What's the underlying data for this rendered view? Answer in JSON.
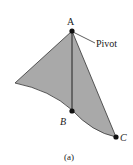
{
  "diagram": {
    "type": "physical-pendulum",
    "colors": {
      "fill": "#a9a9a9",
      "stroke": "#333333",
      "point": "#111111",
      "background": "#ffffff"
    },
    "points": {
      "A": {
        "label": "A",
        "x": 72,
        "y": 31
      },
      "B": {
        "label": "B",
        "x": 72,
        "y": 111
      },
      "C": {
        "label": "C",
        "x": 116,
        "y": 137
      }
    },
    "annotation": {
      "label": "Pivot"
    },
    "caption": "(a)"
  }
}
